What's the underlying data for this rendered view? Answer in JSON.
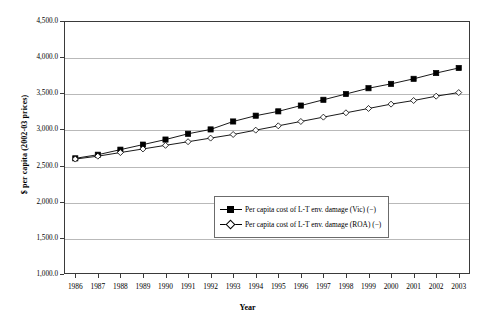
{
  "chart_data": {
    "type": "line",
    "title": "",
    "xlabel": "Year",
    "ylabel": "$ per capita (2002-03 prices)",
    "categories": [
      "1986",
      "1987",
      "1988",
      "1989",
      "1990",
      "1991",
      "1992",
      "1993",
      "1994",
      "1995",
      "1996",
      "1997",
      "1998",
      "1999",
      "2000",
      "2001",
      "2002",
      "2003"
    ],
    "x": [
      1986,
      1987,
      1988,
      1989,
      1990,
      1991,
      1992,
      1993,
      1994,
      1995,
      1996,
      1997,
      1998,
      1999,
      2000,
      2001,
      2002,
      2003
    ],
    "ylim": [
      1000,
      4500
    ],
    "ytick_labels": [
      "4,500.0",
      "4,000.0",
      "3,500.0",
      "3,000.0",
      "2,500.0",
      "2,000.0",
      "1,500.0",
      "1,000.0"
    ],
    "ytick_values": [
      4500,
      4000,
      3500,
      3000,
      2500,
      2000,
      1500,
      1000
    ],
    "grid": true,
    "legend_position": "center",
    "series": [
      {
        "name": "Per capita cost of L-T env. damage (Vic) (−)",
        "marker": "filled-square",
        "color": "#000000",
        "values": [
          2600,
          2650,
          2720,
          2790,
          2860,
          2940,
          3000,
          3110,
          3190,
          3250,
          3330,
          3410,
          3490,
          3570,
          3630,
          3700,
          3780,
          3850
        ]
      },
      {
        "name": "Per capita cost of L-T env. damage (ROA) (−)",
        "marker": "open-diamond",
        "color": "#000000",
        "values": [
          2590,
          2630,
          2680,
          2730,
          2780,
          2830,
          2880,
          2930,
          2990,
          3050,
          3110,
          3170,
          3230,
          3290,
          3350,
          3400,
          3460,
          3510
        ]
      }
    ]
  },
  "legend": {
    "items": [
      {
        "label": "Per capita cost of L-T env. damage (Vic) (−)"
      },
      {
        "label": "Per capita cost of L-T env. damage (ROA) (−)"
      }
    ]
  }
}
